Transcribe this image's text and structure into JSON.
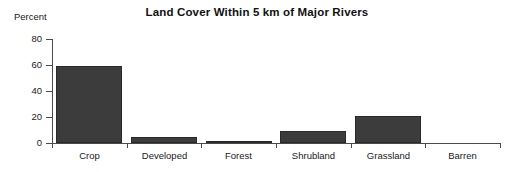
{
  "chart_data": {
    "type": "bar",
    "title": "Land Cover Within 5 km of Major Rivers",
    "xlabel": "",
    "ylabel": "Percent",
    "categories": [
      "Crop",
      "Developed",
      "Forest",
      "Shrubland",
      "Grassland",
      "Barren"
    ],
    "values": [
      59,
      5,
      1.5,
      9.5,
      21,
      0
    ],
    "ylim": [
      0,
      80
    ],
    "yticks": [
      0,
      20,
      40,
      60,
      80
    ],
    "ytick_labels": [
      "0",
      "20",
      "40",
      "60",
      "80"
    ],
    "grid": false,
    "legend": false,
    "series": [
      {
        "name": "Percent",
        "values": [
          59,
          5,
          1.5,
          9.5,
          21,
          0
        ]
      }
    ],
    "bar_color": "#3c3c3c",
    "axis_color": "#4a4a4a",
    "background_color": "#ffffff"
  },
  "axis_caption": "Percent"
}
